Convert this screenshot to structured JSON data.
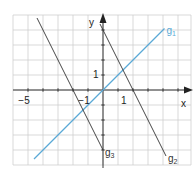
{
  "chart_data": {
    "type": "line",
    "title": "",
    "xlabel": "x",
    "ylabel": "y",
    "xlim": [
      -6,
      6
    ],
    "ylim": [
      -5,
      5
    ],
    "grid": true,
    "grid_step": 1,
    "tick_labels": {
      "x": [
        {
          "value": -5,
          "label": "−5"
        },
        {
          "value": -1,
          "label": "−1"
        },
        {
          "value": 1,
          "label": "1"
        }
      ],
      "y": [
        {
          "value": 1,
          "label": "1"
        }
      ]
    },
    "series": [
      {
        "name": "g1",
        "label_main": "g",
        "label_sub": "1",
        "equation": "y = x",
        "slope": 1,
        "intercept": 0,
        "x_range": [
          -4.6,
          4.1
        ],
        "color": "#5aa9d6"
      },
      {
        "name": "g2",
        "label_main": "g",
        "label_sub": "2",
        "equation": "y = -2x + 4",
        "slope": -2,
        "intercept": 4,
        "x_range": [
          -0.2,
          4.2
        ],
        "color": "#333333"
      },
      {
        "name": "g3",
        "label_main": "g",
        "label_sub": "3",
        "equation": "y = -2x - 4",
        "slope": -2,
        "intercept": -4,
        "x_range": [
          -4.4,
          0.0
        ],
        "color": "#333333"
      }
    ]
  },
  "axes": {
    "x_label": "x",
    "y_label": "y",
    "axis_color": "#222222",
    "grid_color": "#cfcfcf"
  }
}
